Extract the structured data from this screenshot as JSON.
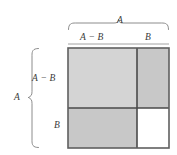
{
  "figure": {
    "name": "difference-of-squares-geometric-proof",
    "labels": {
      "top_total": "A",
      "top_left_segment": "A − B",
      "top_right_segment": "B",
      "left_total": "A",
      "left_top_segment": "A − B",
      "left_bottom_segment": "B"
    },
    "colors": {
      "shaded_light": "#d2d2d2",
      "shaded_medium": "#c9c9c9",
      "unshaded": "#ffffff",
      "outline": "#5b5b5b",
      "divider": "#4a4a4a",
      "brace": "#7a7a7a",
      "text": "#3a3a3a",
      "background": "#ffffff"
    },
    "geometry": {
      "square_left": 68,
      "square_top": 48,
      "square_right": 169,
      "square_bottom": 148,
      "vertical_divider_x": 137,
      "horizontal_divider_y": 108
    },
    "regions": [
      {
        "name": "top-left-region",
        "label": "(A − B) × (A − B)",
        "fill": "shaded_light"
      },
      {
        "name": "top-right-region",
        "label": "B × (A − B)",
        "fill": "shaded_medium"
      },
      {
        "name": "bottom-left-region",
        "label": "(A − B) × B",
        "fill": "shaded_medium"
      },
      {
        "name": "bottom-right-region",
        "label": "B × B",
        "fill": "unshaded"
      }
    ]
  }
}
